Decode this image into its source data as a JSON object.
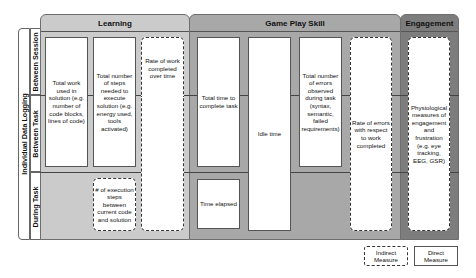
{
  "row_axis": {
    "group_label": "Individual Data Logging",
    "rows": [
      {
        "label": "Between Session"
      },
      {
        "label": "Between Task"
      },
      {
        "label": "During Task"
      }
    ]
  },
  "categories": [
    {
      "title": "Learning",
      "color": "#cbcbcb"
    },
    {
      "title": "Game Play Skill",
      "color": "#a8a8a8"
    },
    {
      "title": "Engagement",
      "color": "#7d7d7d"
    }
  ],
  "measures": [
    {
      "text": "Total work used in solution (e.g. number of code blocks, lines of code)",
      "category": "Learning",
      "type": "direct"
    },
    {
      "text": "Total number of steps needed to execute solution (e.g. energy used, tools activated)",
      "category": "Learning",
      "type": "direct"
    },
    {
      "text": "Rate of work completed over time",
      "category": "Learning",
      "type": "indirect"
    },
    {
      "text": "# of execution steps between current code and solution",
      "category": "Learning",
      "type": "indirect"
    },
    {
      "text": "Total time to complete task",
      "category": "Game Play Skill",
      "type": "direct"
    },
    {
      "text": "Time elapsed",
      "category": "Game Play Skill",
      "type": "direct"
    },
    {
      "text": "Idle time",
      "category": "Game Play Skill",
      "type": "direct"
    },
    {
      "text": "Total number of errors observed during task (syntax, semantic, failed requirements)",
      "category": "Game Play Skill",
      "type": "direct"
    },
    {
      "text": "Rate of errors with respect to work completed",
      "category": "Game Play Skill",
      "type": "indirect"
    },
    {
      "text": "Physiological measures of engagement and frustration (e.g. eye tracking, EEG, GSR)",
      "category": "Engagement",
      "type": "indirect"
    }
  ],
  "legend": {
    "indirect": "Indirect\nMeasure",
    "direct": "Direct\nMeasure"
  }
}
